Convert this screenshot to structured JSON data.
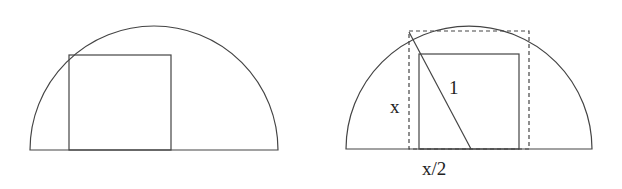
{
  "figures": [
    {
      "name": "semicircle-with-square",
      "semicircle": {
        "cx": 154,
        "baseline_y": 150,
        "r": 124
      },
      "square": {
        "x1": 69,
        "x2": 171,
        "top": 55
      }
    },
    {
      "name": "semicircle-with-inscribed-dashed-rectangle",
      "semicircle": {
        "cx": 469,
        "baseline_y": 149,
        "r": 123
      },
      "dashed_rect": {
        "x1": 409,
        "x2": 529,
        "top": 31
      },
      "square": {
        "x1": 419,
        "x2": 519,
        "top": 54
      },
      "diagonal": {
        "x1": 409,
        "y1": 32,
        "x2": 471,
        "y2": 149
      },
      "labels": {
        "radius": "1",
        "height": "x",
        "half_width": "x/2"
      }
    }
  ],
  "colors": {
    "stroke": "#444444",
    "background": "#ffffff"
  }
}
